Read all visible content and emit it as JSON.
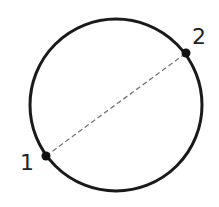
{
  "diagram": {
    "circle": {
      "cx": 116,
      "cy": 105,
      "r": 86,
      "stroke": "#1a1a1a",
      "stroke_width": 3
    },
    "chord": {
      "style": "dashed",
      "color": "#777777"
    },
    "points": [
      {
        "id": "1",
        "label": "1",
        "x": 46,
        "y": 156
      },
      {
        "id": "2",
        "label": "2",
        "x": 186,
        "y": 53
      }
    ]
  }
}
